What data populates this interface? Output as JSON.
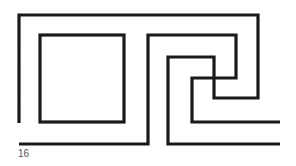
{
  "figure": {
    "stroke_color": "#1a1a1a",
    "paths": [
      {
        "name": "outer-spiral-path"
      },
      {
        "name": "middle-spiral-path"
      },
      {
        "name": "inner-square"
      }
    ]
  },
  "page_number": "16"
}
